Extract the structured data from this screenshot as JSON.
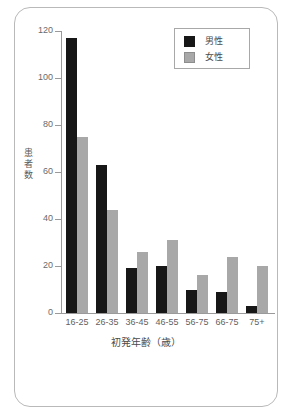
{
  "chart_data": {
    "type": "bar",
    "title": "",
    "subtitle": "",
    "xlabel": "初発年齢（歳）",
    "ylabel": "患者数",
    "categories": [
      "16-25",
      "26-35",
      "36-45",
      "46-55",
      "56-75",
      "66-75",
      "75+"
    ],
    "series": [
      {
        "name": "男性",
        "color": "#171717",
        "values": [
          117,
          63,
          19,
          20,
          10,
          9,
          3
        ]
      },
      {
        "name": "女性",
        "color": "#a8a8a8",
        "values": [
          75,
          44,
          26,
          31,
          16,
          24,
          20
        ]
      }
    ],
    "ylim": [
      0,
      120
    ],
    "ytick_labels": [
      "0",
      "20",
      "40",
      "60",
      "80",
      "100",
      "120"
    ],
    "ytick_values": [
      0,
      20,
      40,
      60,
      80,
      100,
      120
    ],
    "grid": false,
    "legend_position": "top-right",
    "legend_entries": [
      "男性",
      "女性"
    ],
    "annotations": []
  },
  "axes": {
    "y_title_chars": [
      "患",
      "者",
      "数"
    ],
    "x_title": "初発年齢（歳）"
  },
  "colors": {
    "male": "#171717",
    "female": "#a8a8a8",
    "axis": "#9a9a9a",
    "frame": "#b9b9b9",
    "text": "#4a4a4a",
    "background": "#ffffff"
  }
}
